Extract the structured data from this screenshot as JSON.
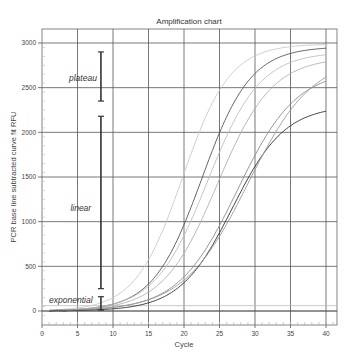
{
  "chart_data": {
    "type": "line",
    "title": "Amplification chart",
    "xlabel": "Cycle",
    "ylabel": "PCR base line subtracted curve fit RFU",
    "xlim": [
      0,
      42
    ],
    "ylim": [
      -300,
      3150
    ],
    "x_ticks": [
      0,
      5,
      10,
      15,
      20,
      25,
      30,
      35,
      40
    ],
    "y_ticks": [
      0,
      500,
      1000,
      1500,
      2000,
      2500,
      3000
    ],
    "grid": true,
    "legend": null,
    "threshold_lines": [
      {
        "y": 0,
        "color": "#555555"
      },
      {
        "y": 60,
        "color": "#bbbbbb"
      }
    ],
    "series": [
      {
        "name": "sample-1",
        "color": "#c8c8c8",
        "midpoint": 19.8,
        "plateau": 2990,
        "slope": 0.3
      },
      {
        "name": "sample-2",
        "color": "#555555",
        "midpoint": 22.5,
        "plateau": 2960,
        "slope": 0.29
      },
      {
        "name": "sample-3",
        "color": "#bdbdbd",
        "midpoint": 23.3,
        "plateau": 2900,
        "slope": 0.27
      },
      {
        "name": "sample-4",
        "color": "#b0b0b0",
        "midpoint": 24.7,
        "plateau": 2840,
        "slope": 0.26
      },
      {
        "name": "sample-5",
        "color": "#8a8a8a",
        "midpoint": 27.5,
        "plateau": 2700,
        "slope": 0.24
      },
      {
        "name": "sample-6",
        "color": "#2f2f2f",
        "midpoint": 26.8,
        "plateau": 2300,
        "slope": 0.27
      },
      {
        "name": "sample-7",
        "color": "#9a9a9a",
        "midpoint": 29.0,
        "plateau": 2850,
        "slope": 0.22
      }
    ],
    "x_range_plotted": [
      1,
      40
    ],
    "annotations": [
      {
        "text": "plateau",
        "x_label": 3.8,
        "y_label": 2580,
        "bracket_x": 8.3,
        "bracket_y": [
          2350,
          2900
        ]
      },
      {
        "text": "linear",
        "x_label": 4.0,
        "y_label": 1120,
        "bracket_x": 8.3,
        "bracket_y": [
          250,
          2180
        ]
      },
      {
        "text": "exponential",
        "x_label": 1.0,
        "y_label": 90,
        "bracket_x": 8.3,
        "bracket_y": [
          10,
          160
        ]
      }
    ]
  }
}
